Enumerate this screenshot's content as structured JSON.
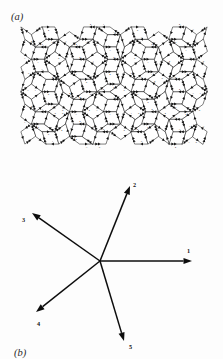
{
  "figure": {
    "panels": [
      {
        "id": "a",
        "label": "(a)",
        "caption_text": "(a)",
        "content": "arrowed Penrose rhombus tiling"
      },
      {
        "id": "b",
        "label": "(b)",
        "caption_text": "(b)",
        "content": "five-fold star of basis vectors"
      }
    ]
  },
  "tiling": {
    "edge_label_values": [
      "1",
      "2",
      "3",
      "4",
      "5"
    ],
    "bounds": {
      "x": 21,
      "y": 22,
      "width": 186,
      "height": 127
    },
    "edge_length": 13.0,
    "vertices_note": "Penrose rhombi, thick (72 deg) and thin (36 deg)",
    "edge_labels": [
      "2",
      "3",
      "2",
      "4",
      "1",
      "2",
      "4",
      "2",
      "3",
      "4",
      "1",
      "2",
      "3",
      "4",
      "5",
      "2",
      "1",
      "3",
      "4",
      "2",
      "3",
      "1",
      "2",
      "4",
      "3",
      "5",
      "1",
      "2",
      "4",
      "3",
      "2",
      "4",
      "1",
      "3",
      "2",
      "4",
      "5",
      "1",
      "3",
      "2",
      "4",
      "1",
      "2",
      "3",
      "4",
      "1",
      "2",
      "3",
      "4",
      "5",
      "2",
      "3",
      "1",
      "4",
      "2",
      "3",
      "4",
      "1",
      "2",
      "5",
      "3",
      "2",
      "4",
      "1",
      "3",
      "2",
      "4",
      "5",
      "1",
      "2",
      "3",
      "4",
      "2",
      "1",
      "3",
      "4",
      "2",
      "5",
      "1",
      "3",
      "2",
      "4",
      "1",
      "2",
      "3",
      "4",
      "5",
      "2",
      "1",
      "3",
      "2",
      "4",
      "3",
      "1",
      "2",
      "4",
      "5",
      "3",
      "1",
      "2"
    ]
  },
  "star": {
    "center": {
      "x": 100,
      "y": 261
    },
    "vectors": [
      {
        "label": "1",
        "angle_deg": 0,
        "tip": {
          "x": 192,
          "y": 261
        },
        "label_pos": {
          "x": 187,
          "y": 249
        }
      },
      {
        "label": "2",
        "angle_deg": 72,
        "tip": {
          "x": 130,
          "y": 186
        },
        "label_pos": {
          "x": 133,
          "y": 183
        }
      },
      {
        "label": "3",
        "angle_deg": 144,
        "tip": {
          "x": 32,
          "y": 213
        },
        "label_pos": {
          "x": 22,
          "y": 218
        }
      },
      {
        "label": "4",
        "angle_deg": 216,
        "tip": {
          "x": 36,
          "y": 312
        },
        "label_pos": {
          "x": 37,
          "y": 322
        }
      },
      {
        "label": "5",
        "angle_deg": 288,
        "tip": {
          "x": 124,
          "y": 341
        },
        "label_pos": {
          "x": 129,
          "y": 345
        }
      }
    ],
    "count": 5,
    "symmetry": "5-fold"
  },
  "colors": {
    "background": "#fdfdfd",
    "ink": "#111111",
    "label_ink": "#2b2b2b",
    "digit_ink": "#303030"
  }
}
